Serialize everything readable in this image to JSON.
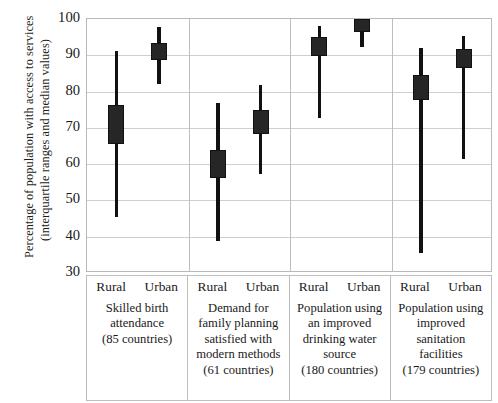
{
  "chart_data": {
    "type": "bar",
    "subtype": "median-with-interquartile-range",
    "title": "",
    "xlabel": "",
    "ylabel": "Percentage of population with access to services (interquartile ranges and median values)",
    "ylabel_lines": [
      "Percentage of population with access to services",
      "(interquartile ranges and median values)"
    ],
    "ylim": [
      30,
      100
    ],
    "yticks": [
      100,
      90,
      80,
      70,
      60,
      50,
      40,
      30
    ],
    "ytick_labels": [
      "100",
      "90",
      "80",
      "70",
      "60",
      "50",
      "40",
      "30"
    ],
    "grid": true,
    "grid_axis": "y",
    "legend": "none",
    "marker_color": "#262626",
    "whisker_color": "#111111",
    "categories": [
      "Rural",
      "Urban"
    ],
    "groups": [
      {
        "name": "Skilled birth attendance",
        "desc_lines": [
          "Skilled birth",
          "attendance",
          "(85 countries)"
        ],
        "countries": 85,
        "countries_label": "(85 countries)",
        "series": [
          {
            "category": "Rural",
            "median": 72.3,
            "q1": 65.5,
            "q3": 76.2,
            "whisker_low": 45.5,
            "whisker_high": 91.3
          },
          {
            "category": "Urban",
            "median": 91.2,
            "q1": 88.6,
            "q3": 93.4,
            "whisker_low": 82.2,
            "whisker_high": 97.7
          }
        ]
      },
      {
        "name": "Demand for family planning satisfied with modern methods",
        "desc_lines": [
          "Demand for",
          "family planning",
          "satisfied with",
          "modern methods",
          "(61 countries)"
        ],
        "countries": 61,
        "countries_label": "(61 countries)",
        "series": [
          {
            "category": "Rural",
            "median": 60.2,
            "q1": 56.2,
            "q3": 64.0,
            "whisker_low": 38.7,
            "whisker_high": 76.8
          },
          {
            "category": "Urban",
            "median": 71.5,
            "q1": 68.2,
            "q3": 75.0,
            "whisker_low": 57.4,
            "whisker_high": 81.7
          }
        ]
      },
      {
        "name": "Population using an improved drinking water source",
        "desc_lines": [
          "Population using",
          "an improved",
          "drinking water",
          "source",
          "(180 countries)"
        ],
        "countries": 180,
        "countries_label": "(180 countries)",
        "series": [
          {
            "category": "Rural",
            "median": 92.4,
            "q1": 89.7,
            "q3": 95.0,
            "whisker_low": 72.6,
            "whisker_high": 98.0
          },
          {
            "category": "Urban",
            "median": 98.4,
            "q1": 96.5,
            "q3": 100.0,
            "whisker_low": 92.4,
            "whisker_high": 100.0
          }
        ]
      },
      {
        "name": "Population using improved sanitation facilities",
        "desc_lines": [
          "Population using",
          "improved",
          "sanitation",
          "facilities",
          "(179 countries)"
        ],
        "countries": 179,
        "countries_label": "(179 countries)",
        "series": [
          {
            "category": "Rural",
            "median": 81.2,
            "q1": 77.6,
            "q3": 84.6,
            "whisker_low": 35.5,
            "whisker_high": 92.0
          },
          {
            "category": "Urban",
            "median": 89.1,
            "q1": 86.4,
            "q3": 91.8,
            "whisker_low": 61.5,
            "whisker_high": 95.4
          }
        ]
      }
    ]
  }
}
